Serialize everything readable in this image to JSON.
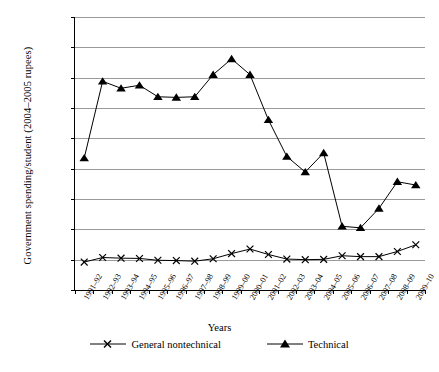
{
  "chart_data": {
    "type": "line",
    "title": "",
    "xlabel": "Years",
    "ylabel": "Government spending/student (2004–2005 rupees)",
    "categories": [
      "1991–92",
      "1992–93",
      "1993–94",
      "1994–95",
      "1995–96",
      "1996–97",
      "1997–98",
      "1998–99",
      "1999–00",
      "2000–01",
      "2001–02",
      "2002–03",
      "2003–04",
      "2004–05",
      "2005–06",
      "2006–07",
      "2007–08",
      "2008–09",
      "2009–10"
    ],
    "ylim": [
      0,
      90000
    ],
    "ytick_values": [
      0,
      10000,
      20000,
      30000,
      40000,
      50000,
      60000,
      70000,
      80000,
      90000
    ],
    "ytick_labels": [
      "0",
      "10,000",
      "20,000",
      "30,000",
      "40,000",
      "50,000",
      "60,000",
      "70,000",
      "80,000",
      "90,000"
    ],
    "grid": true,
    "legend_position": "bottom",
    "series": [
      {
        "name": "General nontechnical",
        "marker": "x",
        "color": "#000000",
        "values": [
          9200,
          10700,
          10500,
          10400,
          9800,
          9700,
          9500,
          10300,
          12000,
          13500,
          11700,
          10200,
          10000,
          10100,
          11300,
          11000,
          11000,
          12700,
          14900
        ]
      },
      {
        "name": "Technical",
        "marker": "triangle",
        "color": "#000000",
        "values": [
          43500,
          68800,
          66500,
          67500,
          63700,
          63500,
          63700,
          71000,
          76200,
          71000,
          56100,
          44000,
          38900,
          45200,
          21000,
          20500,
          26900,
          35700,
          34600
        ]
      }
    ]
  },
  "legend": {
    "items": [
      {
        "label": "General nontechnical",
        "marker": "x-marker"
      },
      {
        "label": "Technical",
        "marker": "triangle-marker"
      }
    ]
  }
}
